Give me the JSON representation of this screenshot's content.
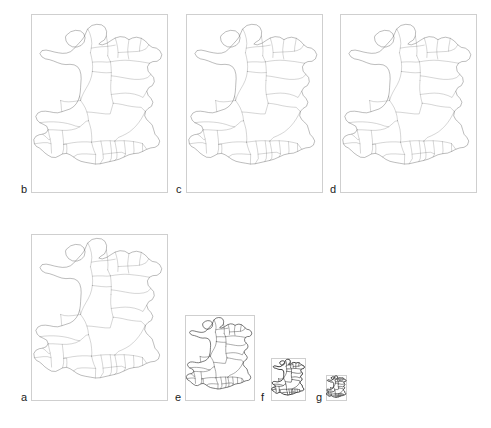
{
  "figure": {
    "title": "",
    "background_color": "#ffffff",
    "box_border_color": "#cfcfcf",
    "map_outline_color": "#3a3a3a",
    "map_boundary_color": "#555555",
    "label_color": "#1a1a1a"
  },
  "panels": [
    {
      "id": "b",
      "label": "b",
      "box": {
        "x": 31,
        "y": 14,
        "width": 137,
        "height": 179
      },
      "label_pos": {
        "x": 21,
        "y": 184
      },
      "map_detail": "high",
      "scale": 1.0
    },
    {
      "id": "c",
      "label": "c",
      "box": {
        "x": 186,
        "y": 14,
        "width": 137,
        "height": 179
      },
      "label_pos": {
        "x": 176,
        "y": 184
      },
      "map_detail": "high",
      "scale": 1.0
    },
    {
      "id": "d",
      "label": "d",
      "box": {
        "x": 340,
        "y": 14,
        "width": 137,
        "height": 179
      },
      "label_pos": {
        "x": 330,
        "y": 184
      },
      "map_detail": "medium",
      "scale": 1.0
    },
    {
      "id": "a",
      "label": "a",
      "box": {
        "x": 31,
        "y": 234,
        "width": 137,
        "height": 167
      },
      "label_pos": {
        "x": 21,
        "y": 392
      },
      "map_detail": "high",
      "scale": 1.0
    },
    {
      "id": "e",
      "label": "e",
      "box": {
        "x": 185,
        "y": 315,
        "width": 70,
        "height": 86
      },
      "label_pos": {
        "x": 175,
        "y": 392
      },
      "map_detail": "high",
      "scale": 0.51
    },
    {
      "id": "f",
      "label": "f",
      "box": {
        "x": 271,
        "y": 358,
        "width": 35,
        "height": 43
      },
      "label_pos": {
        "x": 261,
        "y": 392
      },
      "map_detail": "high",
      "scale": 0.26
    },
    {
      "id": "g",
      "label": "g",
      "box": {
        "x": 326,
        "y": 375,
        "width": 21,
        "height": 26
      },
      "label_pos": {
        "x": 316,
        "y": 392
      },
      "map_detail": "high",
      "scale": 0.155
    }
  ],
  "chart_data": {
    "type": "map",
    "title": "",
    "panel_labels": [
      "a",
      "b",
      "c",
      "d",
      "e",
      "f",
      "g"
    ],
    "panel_count": 7
  }
}
